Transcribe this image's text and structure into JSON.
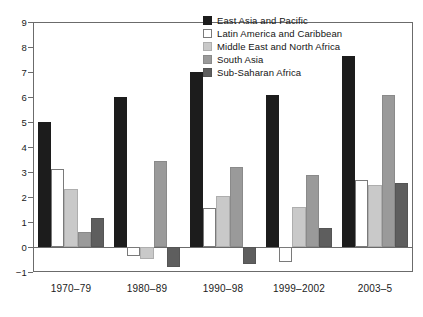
{
  "chart_data": {
    "type": "bar",
    "title": "",
    "subtitle": "",
    "xlabel": "",
    "ylabel": "",
    "ylim": [
      -1,
      9
    ],
    "yticks": [
      -1,
      0,
      1,
      2,
      3,
      4,
      5,
      6,
      7,
      8,
      9
    ],
    "ytick_labels": [
      "−1",
      "0",
      "1",
      "2",
      "3",
      "4",
      "5",
      "6",
      "7",
      "8",
      "9"
    ],
    "grid": false,
    "legend_position": "top-center",
    "zero_line": true,
    "categories": [
      "1970–79",
      "1980–89",
      "1990–98",
      "1999–2002",
      "2003–5"
    ],
    "series": [
      {
        "name": "East Asia and Pacific",
        "color": "#1c1c1c",
        "values": [
          5.02,
          6.02,
          7.02,
          6.1,
          7.66
        ]
      },
      {
        "name": "Latin America and Caribbean",
        "color": "#ffffff",
        "values": [
          3.13,
          -0.37,
          1.56,
          -0.59,
          2.69
        ]
      },
      {
        "name": "Middle East and North Africa",
        "color": "#c9c9c9",
        "values": [
          2.32,
          -0.46,
          2.04,
          1.61,
          2.49
        ]
      },
      {
        "name": "South Asia",
        "color": "#9a9a9a",
        "values": [
          0.62,
          3.45,
          3.2,
          2.88,
          6.07
        ]
      },
      {
        "name": "Sub-Saharan Africa",
        "color": "#5e5e5e",
        "values": [
          1.16,
          -0.79,
          -0.67,
          0.75,
          2.55
        ]
      }
    ]
  },
  "legend": {
    "entries": [
      {
        "label": "East Asia and Pacific",
        "swatch": "series-0-swatch"
      },
      {
        "label": "Latin America and Caribbean",
        "swatch": "series-1-swatch"
      },
      {
        "label": "Middle East and North Africa",
        "swatch": "series-2-swatch"
      },
      {
        "label": "South Asia",
        "swatch": "series-3-swatch"
      },
      {
        "label": "Sub-Saharan Africa",
        "swatch": "series-4-swatch"
      }
    ]
  },
  "colors": {
    "axis": "#6b6b6b",
    "text": "#1a1a1a",
    "background": "#ffffff"
  }
}
